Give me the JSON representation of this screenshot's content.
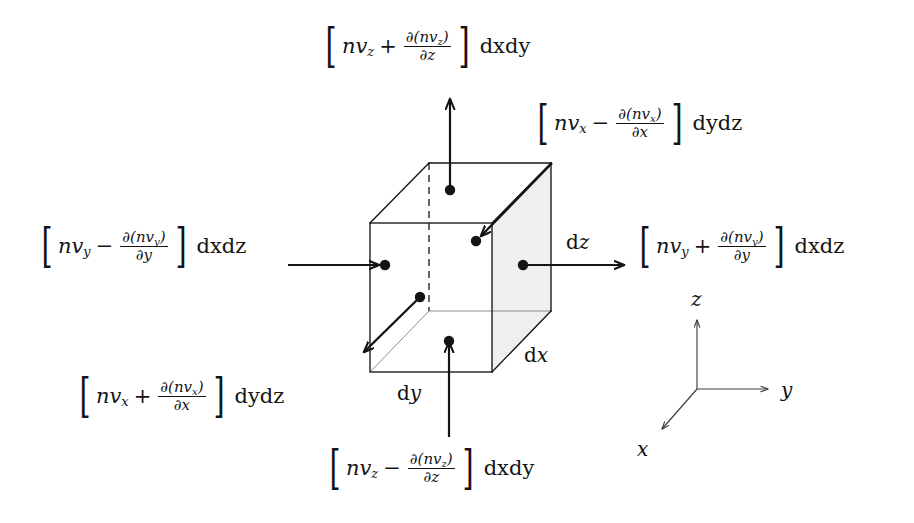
{
  "figure": {
    "type": "physics-diagram",
    "background_color": "#ffffff",
    "stroke_color": "#141414",
    "shade_color": "#efefef"
  },
  "flux_labels": {
    "top": {
      "id": "flux-top",
      "symbol": "nv",
      "symbol_sub": "z",
      "operator": "+",
      "numerator": "∂(nv",
      "numerator_sub": "z",
      "numerator_close": ")",
      "denominator": "∂z",
      "tail": "dxdy",
      "text": "[nv_z + ∂(nv_z)/∂z] dxdy"
    },
    "top_right": {
      "id": "flux-top-right",
      "symbol": "nv",
      "symbol_sub": "x",
      "operator": "−",
      "numerator": "∂(nv",
      "numerator_sub": "x",
      "numerator_close": ")",
      "denominator": "∂x",
      "tail": "dydz",
      "text": "[nv_x − ∂(nv_x)/∂x] dydz"
    },
    "left": {
      "id": "flux-left",
      "symbol": "nv",
      "symbol_sub": "y",
      "operator": "−",
      "numerator": "∂(nv",
      "numerator_sub": "y",
      "numerator_close": ")",
      "denominator": "∂y",
      "tail": "dxdz",
      "text": "[nv_y − ∂(nv_y)/∂y] dxdz"
    },
    "right": {
      "id": "flux-right",
      "symbol": "nv",
      "symbol_sub": "y",
      "operator": "+",
      "numerator": "∂(nv",
      "numerator_sub": "y",
      "numerator_close": ")",
      "denominator": "∂y",
      "tail": "dxdz",
      "text": "[nv_y + ∂(nv_y)/∂y] dxdz"
    },
    "bottom_left": {
      "id": "flux-bottom-left",
      "symbol": "nv",
      "symbol_sub": "x",
      "operator": "+",
      "numerator": "∂(nv",
      "numerator_sub": "x",
      "numerator_close": ")",
      "denominator": "∂x",
      "tail": "dydz",
      "text": "[nv_x + ∂(nv_x)/∂x] dydz"
    },
    "bottom": {
      "id": "flux-bottom",
      "symbol": "nv",
      "symbol_sub": "z",
      "operator": "−",
      "numerator": "∂(nv",
      "numerator_sub": "z",
      "numerator_close": ")",
      "denominator": "∂z",
      "tail": "dxdy",
      "text": "[nv_z − ∂(nv_z)/∂z] dxdy"
    }
  },
  "dimension_labels": {
    "dz": {
      "prefix": "d",
      "var": "z",
      "text": "dz"
    },
    "dx": {
      "prefix": "d",
      "var": "x",
      "text": "dx"
    },
    "dy": {
      "prefix": "d",
      "var": "y",
      "text": "dy"
    }
  },
  "axes": {
    "z": {
      "label": "z",
      "direction": "up"
    },
    "y": {
      "label": "y",
      "direction": "right"
    },
    "x": {
      "label": "x",
      "direction": "down-left"
    }
  }
}
